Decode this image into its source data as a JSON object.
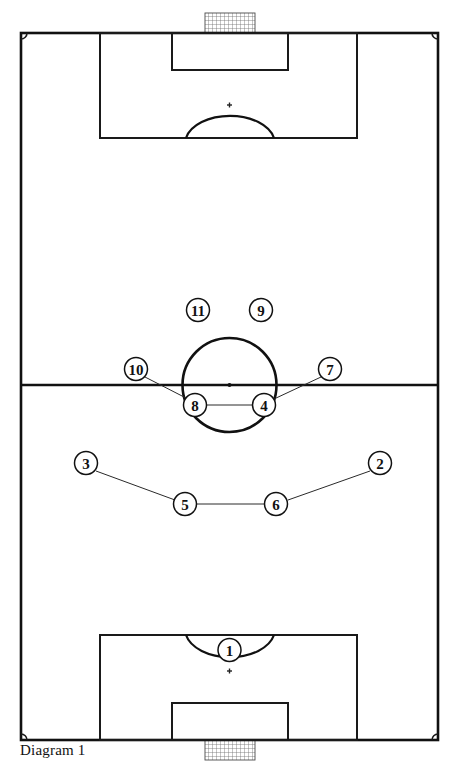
{
  "diagram": {
    "caption": "Diagram 1",
    "caption_x": 20,
    "caption_y": 742,
    "type": "soccer-formation-pitch",
    "colors": {
      "line": "#1a1a1a",
      "field": "#ffffff",
      "marker_fill": "#ffffff",
      "marker_stroke": "#111111",
      "net": "#4a4a4a"
    }
  },
  "pitch": {
    "left": 21,
    "right": 438,
    "top": 33,
    "bottom": 740,
    "halfway_y": 385,
    "corner_arc_radius": 6,
    "center_circle": {
      "cx": 229.5,
      "cy": 385,
      "r": 47
    },
    "center_spot": {
      "cx": 229.5,
      "cy": 385,
      "r": 2
    }
  },
  "top_goal": {
    "penalty_box": {
      "x": 100,
      "y": 33,
      "width": 257,
      "height": 105
    },
    "goal_box": {
      "x": 172,
      "y": 33,
      "width": 116,
      "height": 37
    },
    "penalty_spot": {
      "cx": 229.5,
      "cy": 105,
      "size": 5
    },
    "arc": {
      "start_x": 186,
      "start_y": 138,
      "end_x": 274,
      "end_y": 138,
      "rx": 45,
      "ry": 28,
      "sweep": 1
    },
    "net": {
      "x": 205,
      "y": 13,
      "width": 50,
      "height": 20
    }
  },
  "bottom_goal": {
    "penalty_box": {
      "x": 100,
      "y": 635,
      "width": 257,
      "height": 105
    },
    "goal_box": {
      "x": 172,
      "y": 703,
      "width": 116,
      "height": 37
    },
    "penalty_spot": {
      "cx": 229.5,
      "cy": 671,
      "size": 5
    },
    "arc": {
      "start_x": 186,
      "start_y": 635,
      "end_x": 274,
      "end_y": 635,
      "rx": 45,
      "ry": 28,
      "sweep": 0
    },
    "net": {
      "x": 205,
      "y": 740,
      "width": 50,
      "height": 20
    }
  },
  "marker_radius": 11.5,
  "players": [
    {
      "number": "1",
      "cx": 229.5,
      "cy": 650,
      "role": "goalkeeper"
    },
    {
      "number": "2",
      "cx": 380,
      "cy": 463,
      "role": "right-back"
    },
    {
      "number": "3",
      "cx": 86,
      "cy": 463,
      "role": "left-back"
    },
    {
      "number": "4",
      "cx": 264,
      "cy": 405,
      "role": "center-midfield-right"
    },
    {
      "number": "5",
      "cx": 185,
      "cy": 504,
      "role": "center-back-left"
    },
    {
      "number": "6",
      "cx": 276,
      "cy": 504,
      "role": "center-back-right"
    },
    {
      "number": "7",
      "cx": 330,
      "cy": 369,
      "role": "right-midfield"
    },
    {
      "number": "8",
      "cx": 195,
      "cy": 405,
      "role": "center-midfield-left"
    },
    {
      "number": "9",
      "cx": 261,
      "cy": 310,
      "role": "striker-right"
    },
    {
      "number": "10",
      "cx": 136,
      "cy": 369,
      "role": "left-midfield"
    },
    {
      "number": "11",
      "cx": 198,
      "cy": 310,
      "role": "striker-left"
    }
  ],
  "connectors": [
    {
      "from": "3",
      "to": "5",
      "x1": 96,
      "y1": 471,
      "x2": 175,
      "y2": 500
    },
    {
      "from": "5",
      "to": "6",
      "x1": 197,
      "y1": 504,
      "x2": 264,
      "y2": 504
    },
    {
      "from": "6",
      "to": "2",
      "x1": 288,
      "y1": 500,
      "x2": 370,
      "y2": 471
    },
    {
      "from": "10",
      "to": "8",
      "x1": 145,
      "y1": 377,
      "x2": 186,
      "y2": 398
    },
    {
      "from": "8",
      "to": "4",
      "x1": 207,
      "y1": 405,
      "x2": 252,
      "y2": 405
    },
    {
      "from": "4",
      "to": "7",
      "x1": 274,
      "y1": 399,
      "x2": 321,
      "y2": 377
    }
  ]
}
